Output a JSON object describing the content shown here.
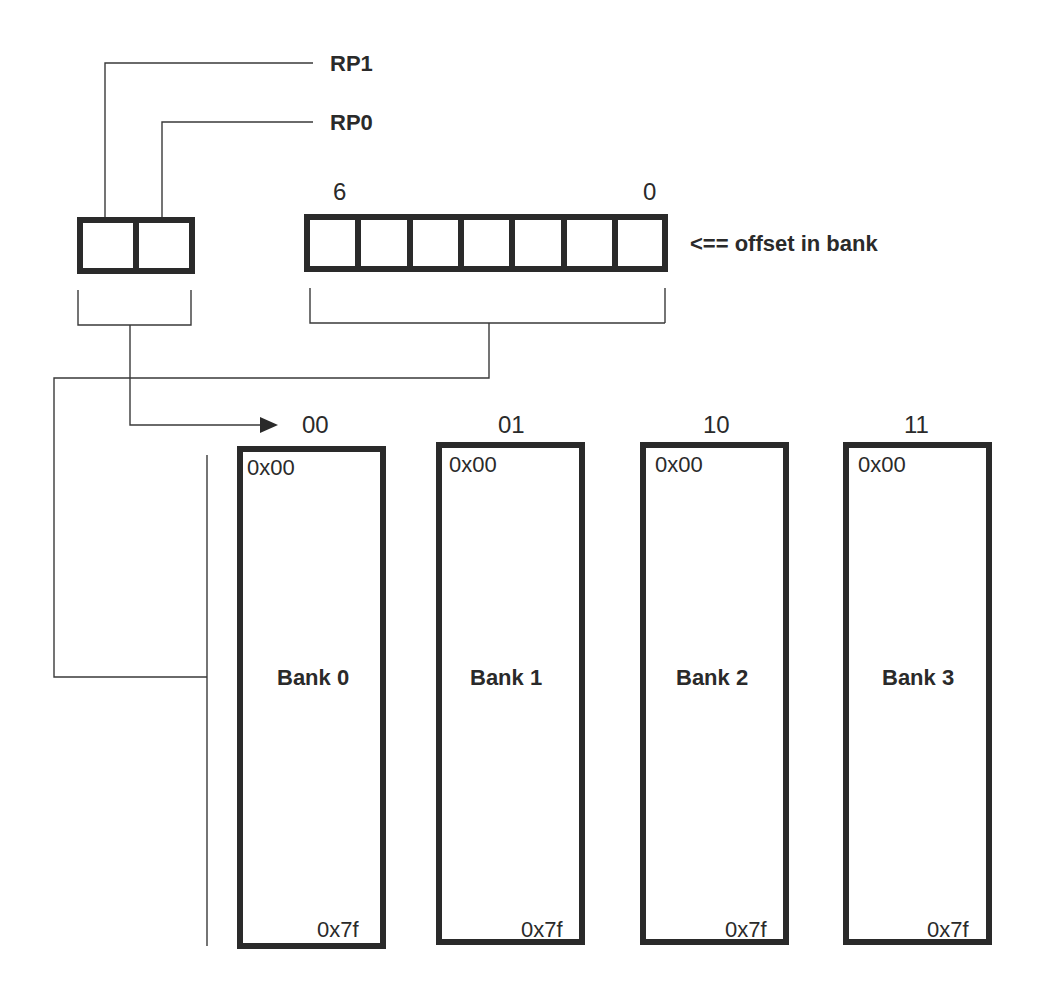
{
  "diagram": {
    "rp_labels": {
      "rp1": "RP1",
      "rp0": "RP0"
    },
    "offset_register": {
      "bit_count": 7,
      "msb_label": "6",
      "lsb_label": "0",
      "caption": "<== offset in bank"
    },
    "bank_select_bits": 2,
    "banks": [
      {
        "select": "00",
        "name": "Bank 0",
        "start": "0x00",
        "end": "0x7f"
      },
      {
        "select": "01",
        "name": "Bank 1",
        "start": "0x00",
        "end": "0x7f"
      },
      {
        "select": "10",
        "name": "Bank 2",
        "start": "0x00",
        "end": "0x7f"
      },
      {
        "select": "11",
        "name": "Bank 3",
        "start": "0x00",
        "end": "0x7f"
      }
    ],
    "colors": {
      "line": "#2a2a2a",
      "background": "#ffffff"
    }
  }
}
